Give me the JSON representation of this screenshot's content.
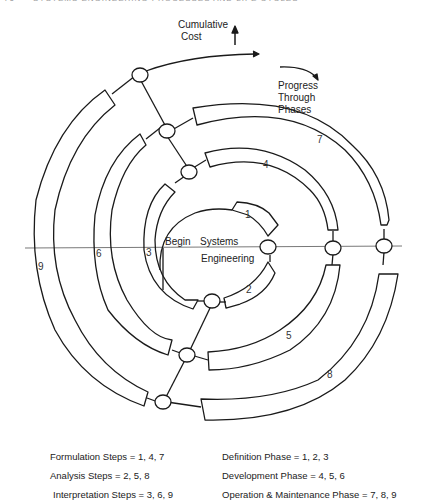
{
  "header": {
    "page_number": "76",
    "running_title": "SYSTEMS ENGINEERING PROCESSES AND LIFE CYCLES"
  },
  "diagram": {
    "axis_labels": {
      "cost_line1": "Cumulative",
      "cost_line2": "Cost",
      "progress_line1": "Progress",
      "progress_line2": "Through",
      "progress_line3": "Phases"
    },
    "center": {
      "begin": "Begin",
      "systems": "Systems",
      "engineering": "Engineering"
    },
    "step_numbers": [
      "1",
      "2",
      "3",
      "4",
      "5",
      "6",
      "7",
      "8",
      "9"
    ],
    "colors": {
      "stroke": "#1a1a1a",
      "axis": "#555555",
      "background": "#ffffff"
    }
  },
  "legend": {
    "steps": [
      "Formulation Steps = 1, 4, 7",
      "Analysis Steps = 2, 5, 8",
      "Interpretation Steps = 3, 6, 9"
    ],
    "phases": [
      "Definition Phase = 1, 2, 3",
      "Development Phase = 4, 5, 6",
      "Operation & Maintenance Phase = 7, 8, 9"
    ]
  }
}
